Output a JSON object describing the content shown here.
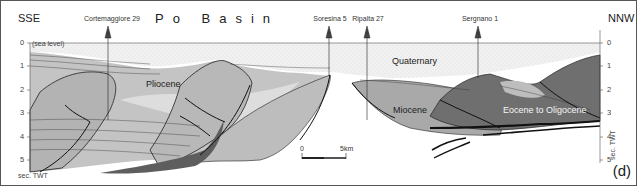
{
  "figure": {
    "title": "Po Basin",
    "panel_label": "(d)",
    "direction_left": "SSE",
    "direction_right": "NNW",
    "sea_level_label": "(sea level)",
    "axis_unit_left": "sec. TWT",
    "axis_unit_right": "sec. TWT",
    "depth_ticks": [
      "0",
      "1",
      "2",
      "3",
      "4",
      "5"
    ],
    "wells": [
      {
        "name": "Cortemaggiore 29"
      },
      {
        "name": "Soresina 5"
      },
      {
        "name": "Ripalta 27"
      },
      {
        "name": "Sergnano 1"
      }
    ],
    "formations": {
      "quaternary": "Quaternary",
      "pliocene": "Pliocene",
      "miocene": "Miocene",
      "eocene_oligocene": "Eocene to Oligocene"
    },
    "scale_bar": {
      "start": "0",
      "end": "5km"
    },
    "colors": {
      "quaternary_fill": "#eeeeee",
      "pliocene_fill": "#c2c2c2",
      "miocene_fill": "#a8a8a8",
      "eocene_fill": "#6e6e6e",
      "dark_wedge": "#5a5a5a",
      "line": "#222222"
    }
  }
}
